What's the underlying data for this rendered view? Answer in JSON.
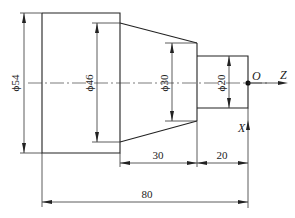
{
  "drawing": {
    "title": "Stepped shaft turning part with coordinate system",
    "dimensions": {
      "dia_54": "ϕ54",
      "dia_46": "ϕ46",
      "dia_30": "ϕ30",
      "dia_20": "ϕ20",
      "len_30": "30",
      "len_20": "20",
      "len_80": "80"
    },
    "axes": {
      "origin": "O",
      "z_axis": "Z",
      "x_axis": "X"
    }
  }
}
